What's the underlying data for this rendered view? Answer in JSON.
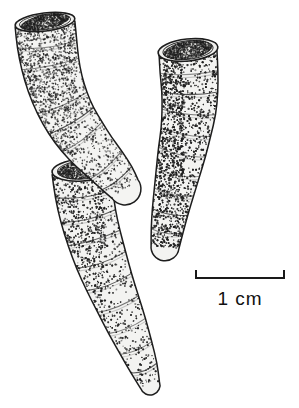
{
  "figure": {
    "type": "scientific-line-drawing",
    "technique": "stipple pen-and-ink illustration",
    "background_color": "#ffffff",
    "ink_color": "#1a1a1a",
    "fill_color": "#f2f2f0",
    "width": 299,
    "height": 408
  },
  "scalebar": {
    "label": "1 cm",
    "value": 1,
    "unit": "cm",
    "bar_x_start": 196,
    "bar_x_end": 284,
    "bar_y": 278,
    "tick_height": 8,
    "label_x": 240,
    "label_y": 305,
    "line_color": "#1a1a1a",
    "line_width": 2
  },
  "specimens": [
    {
      "id": "specimen-upper-left",
      "name": "upper left corallum",
      "description": "elongate tapering tube with open elliptical calice at top, curving down to the right and ending in a blunt rounded tip",
      "calice_open": true,
      "calice_center_x": 45,
      "calice_center_y": 22,
      "calice_rx": 30,
      "calice_ry": 9,
      "tip_x": 128,
      "tip_y": 196,
      "growth_ring_count": 7
    },
    {
      "id": "specimen-lower-left",
      "name": "lower left corallum",
      "description": "long tapering tube with open elliptical calice at upper end, extending down-right to a narrow rounded distal tip",
      "calice_open": true,
      "calice_center_x": 82,
      "calice_center_y": 170,
      "calice_rx": 30,
      "calice_ry": 11,
      "tip_x": 152,
      "tip_y": 392,
      "growth_ring_count": 9
    },
    {
      "id": "specimen-right",
      "name": "right corallum",
      "description": "curved tapering tube with broad open calice at top showing inner cavity, narrowing downward to a blunt distal end",
      "calice_open": true,
      "calice_center_x": 188,
      "calice_center_y": 50,
      "calice_rx": 30,
      "calice_ry": 11,
      "tip_x": 166,
      "tip_y": 251,
      "growth_ring_count": 9
    }
  ]
}
